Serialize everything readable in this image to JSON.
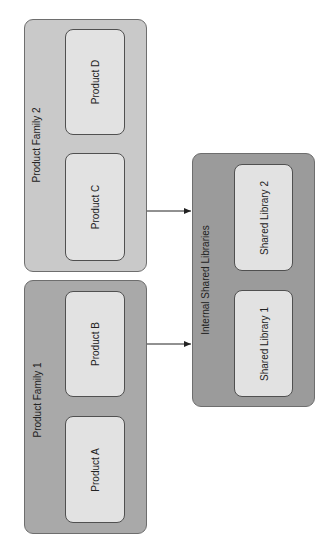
{
  "diagram": {
    "orientation": "rotated -90deg",
    "groups": [
      {
        "id": "family2",
        "label": "Product Family 2",
        "color": "#c9c9c9",
        "nodes": [
          {
            "id": "productD",
            "label": "Product D"
          },
          {
            "id": "productC",
            "label": "Product C"
          }
        ]
      },
      {
        "id": "family1",
        "label": "Product Family 1",
        "color": "#a9a9a9",
        "nodes": [
          {
            "id": "productB",
            "label": "Product B"
          },
          {
            "id": "productA",
            "label": "Product A"
          }
        ]
      },
      {
        "id": "shared",
        "label": "Internal Shared Libraries",
        "color": "#9b9b9b",
        "nodes": [
          {
            "id": "sharedLib2",
            "label": "Shared Library 2"
          },
          {
            "id": "sharedLib1",
            "label": "Shared Library 1"
          }
        ]
      }
    ],
    "edges": [
      {
        "from": "Product Family 2",
        "to": "Internal Shared Libraries"
      },
      {
        "from": "Product Family 1",
        "to": "Internal Shared Libraries"
      }
    ],
    "node_color": "#e2e2e2",
    "edge_color": "#222222"
  }
}
